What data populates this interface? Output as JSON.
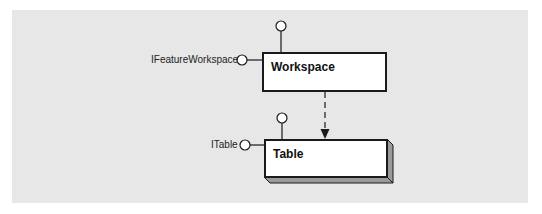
{
  "diagram": {
    "background_color": "#e7e7e7",
    "classes": [
      {
        "name": "Workspace",
        "kind": "cocreatable-class",
        "interfaces": [
          {
            "label": "IFeatureWorkspace",
            "position": "left"
          },
          {
            "label": "",
            "position": "top"
          }
        ]
      },
      {
        "name": "Table",
        "kind": "instantiable-class-3d",
        "interfaces": [
          {
            "label": "ITable",
            "position": "left"
          },
          {
            "label": "",
            "position": "top"
          }
        ]
      }
    ],
    "relationships": [
      {
        "from": "Workspace",
        "to": "Table",
        "type": "instantiation",
        "style": "dashed-arrow"
      }
    ]
  }
}
